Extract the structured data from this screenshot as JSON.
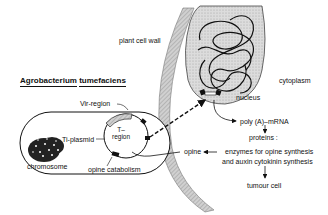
{
  "diagram": {
    "title": {
      "genus": "Agrobacterium",
      "species": "tumefaciens"
    },
    "bacterium": {
      "labels": {
        "vir_region": "Vir-region",
        "t_region": "T-\nregion",
        "t_region_line1": "T–",
        "t_region_line2": "region",
        "ti_plasmid": "Ti-plasmid",
        "chromosome": "chromosome",
        "opine_catabolism": "opine catabolism"
      }
    },
    "plant_cell": {
      "labels": {
        "cell_wall": "plant cell wall",
        "nucleus": "nucleus",
        "cytoplasm": "cytoplasm"
      }
    },
    "pathway": {
      "mrna": "poly (A)–mRNA",
      "proteins": "proteins :",
      "enzymes_line1": "enzymes for opine synthesis",
      "enzymes_line2": "and auxin cytokinin synthesis",
      "tumour_cell": "tumour cell",
      "opine": "opine"
    },
    "colors": {
      "ink": "#111111",
      "stipple_fill": "#d4d4d4",
      "wall_fill": "#c8c8c8",
      "background": "#ffffff"
    }
  }
}
